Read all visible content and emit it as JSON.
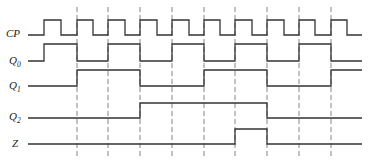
{
  "diagram": {
    "type": "timing-diagram",
    "colors": {
      "line": "#333333",
      "dash": "#666666",
      "background": "#ffffff"
    },
    "x_start": 28,
    "x_end": 362,
    "dashed_lines": {
      "x": [
        77,
        108,
        140,
        172,
        204,
        235,
        267,
        299,
        331
      ],
      "y_top": 7,
      "y_bottom": 156
    },
    "signals": [
      {
        "id": "cp",
        "name": "CP",
        "subscript": "",
        "label_y": 37,
        "high_y": 20,
        "low_y": 35,
        "initial": 0,
        "edges": [
          44,
          61,
          77,
          93,
          108,
          125,
          140,
          157,
          172,
          189,
          204,
          220,
          235,
          252,
          267,
          284,
          299,
          315,
          331,
          347
        ]
      },
      {
        "id": "q0",
        "name": "Q",
        "subscript": "0",
        "label_y": 64,
        "high_y": 44,
        "low_y": 61,
        "initial": 0,
        "edges": [
          44,
          77,
          108,
          140,
          172,
          204,
          235,
          267,
          299,
          331
        ]
      },
      {
        "id": "q1",
        "name": "Q",
        "subscript": "1",
        "label_y": 89,
        "high_y": 70,
        "low_y": 86,
        "initial": 0,
        "edges": [
          77,
          140,
          204,
          267,
          331
        ]
      },
      {
        "id": "q2",
        "name": "Q",
        "subscript": "2",
        "label_y": 120,
        "high_y": 103,
        "low_y": 118,
        "initial": 0,
        "edges": [
          140,
          267
        ]
      },
      {
        "id": "z",
        "name": "Z",
        "subscript": "",
        "label_y": 147,
        "high_y": 129,
        "low_y": 144,
        "initial": 0,
        "edges": [
          235,
          267
        ]
      }
    ],
    "state_sequence": [
      "000",
      "001",
      "010",
      "011",
      "100",
      "101",
      "110",
      "111",
      "000",
      "001",
      "010"
    ]
  }
}
